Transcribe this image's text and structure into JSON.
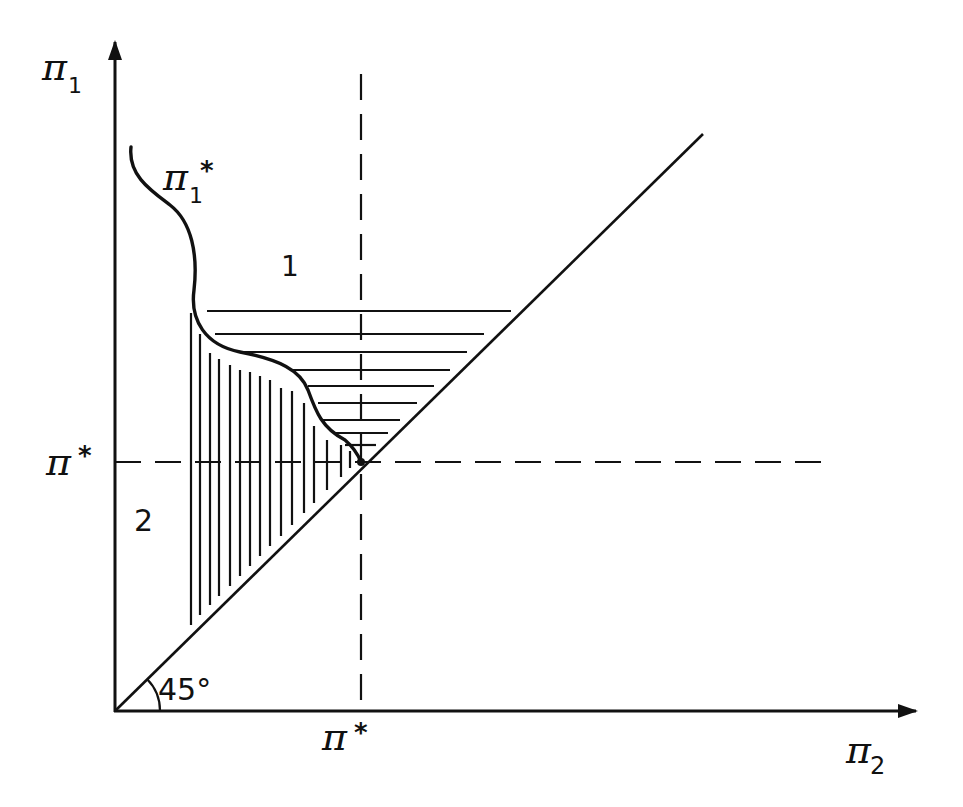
{
  "diagram": {
    "colors": {
      "ink": "#111111",
      "background": "#ffffff"
    },
    "axes": {
      "x_label": "π",
      "x_label_sub": "2",
      "y_label": "π",
      "y_label_sub": "1"
    },
    "markers": {
      "x_threshold_label": "π",
      "x_threshold_star": "*",
      "y_threshold_label": "π",
      "y_threshold_star": "*"
    },
    "curve": {
      "label": "π",
      "label_sub": "1",
      "label_star": "*"
    },
    "regions": {
      "region_1": "1",
      "region_2": "2"
    },
    "angle": {
      "label": "45°"
    }
  }
}
